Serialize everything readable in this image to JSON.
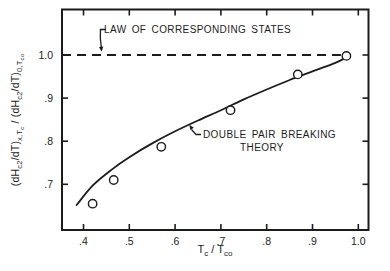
{
  "figure": {
    "background": "#ffffff",
    "ink_color": "#1c1c1c"
  },
  "annotations": {
    "law_label": "LAW OF CORRESPONDING STATES",
    "theory_label_line1": "DOUBLE PAIR BREAKING",
    "theory_label_line2": "THEORY"
  },
  "x_axis_label": {
    "p0": "T",
    "p1": "c",
    "p2": " / T",
    "p3": "co"
  },
  "y_axis_label": {
    "p0": "(dH",
    "p1": "c2",
    "p2": "/dT)",
    "p3": "x,T",
    "p4": "c",
    "p5": " / (dH",
    "p6": "c2",
    "p7": "/dT)",
    "p8": "0,T",
    "p9": "co"
  },
  "chart_data": {
    "type": "scatter",
    "title": "",
    "xlabel": "Tc / Tco",
    "ylabel": "(dHc2/dT)x,Tc / (dHc2/dT)0,Tco",
    "grid": false,
    "legend": "none",
    "xlim": [
      0.3531,
      1.0223
    ],
    "ylim": [
      0.594,
      1.1056
    ],
    "x_ticks": [
      0.4,
      0.5,
      0.6,
      0.7,
      0.8,
      0.9,
      1.0
    ],
    "x_tick_labels": [
      ".4",
      ".5",
      ".6",
      ".7",
      ".8",
      ".9",
      "1.0"
    ],
    "y_ticks": [
      1.0,
      0.9,
      0.8,
      0.7
    ],
    "y_tick_labels": [
      "1.0",
      ".9",
      ".8",
      ".7"
    ],
    "reference_line": {
      "y": 1.0,
      "style": "dashed",
      "x_start_at_axis": true,
      "x_end": 0.962,
      "label": "LAW OF CORRESPONDING STATES"
    },
    "series": [
      {
        "name": "experimental points",
        "type": "scatter",
        "marker": "open-circle",
        "x": [
          0.42,
          0.466,
          0.57,
          0.721,
          0.868,
          0.974
        ],
        "y": [
          0.655,
          0.71,
          0.787,
          0.872,
          0.955,
          0.998
        ]
      },
      {
        "name": "DOUBLE PAIR BREAKING THEORY",
        "type": "line",
        "x": [
          0.385,
          0.42,
          0.46,
          0.5,
          0.55,
          0.6,
          0.65,
          0.7,
          0.75,
          0.8,
          0.85,
          0.9,
          0.95,
          0.975
        ],
        "y": [
          0.652,
          0.697,
          0.733,
          0.763,
          0.795,
          0.823,
          0.848,
          0.872,
          0.897,
          0.92,
          0.942,
          0.962,
          0.982,
          0.995
        ]
      }
    ]
  }
}
